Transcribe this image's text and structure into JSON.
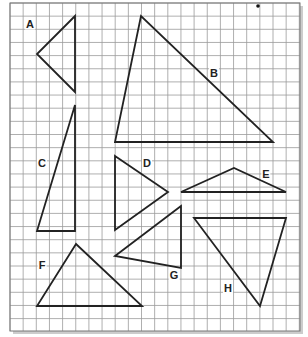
{
  "figure": {
    "grid": {
      "x0": 10,
      "y0": 3,
      "x1": 300,
      "y1": 331,
      "cell": 13.15,
      "line_color": "#9a9a9a",
      "border_color": "#777777",
      "background": "#ffffff",
      "shadow_color": "#cccccc"
    },
    "stroke_color": "#222222",
    "dot": {
      "x": 258,
      "y": 6
    },
    "triangles": [
      {
        "label": "A",
        "points": [
          [
            75,
            16
          ],
          [
            37,
            54
          ],
          [
            75,
            92
          ]
        ],
        "label_pos": [
          30,
          24
        ]
      },
      {
        "label": "B",
        "points": [
          [
            141,
            16
          ],
          [
            115,
            142
          ],
          [
            273,
            142
          ]
        ],
        "label_pos": [
          214,
          73
        ]
      },
      {
        "label": "C",
        "points": [
          [
            75,
            105
          ],
          [
            37,
            231
          ],
          [
            75,
            231
          ]
        ],
        "label_pos": [
          42,
          163
        ]
      },
      {
        "label": "D",
        "points": [
          [
            115,
            156
          ],
          [
            168,
            192
          ],
          [
            115,
            230
          ]
        ],
        "label_pos": [
          147,
          163
        ]
      },
      {
        "label": "E",
        "points": [
          [
            181,
            192
          ],
          [
            234,
            168
          ],
          [
            286,
            192
          ]
        ],
        "label_pos": [
          266,
          174
        ]
      },
      {
        "label": "F",
        "points": [
          [
            76,
            244
          ],
          [
            37,
            306
          ],
          [
            142,
            306
          ]
        ],
        "label_pos": [
          42,
          265
        ]
      },
      {
        "label": "G",
        "points": [
          [
            181,
            206
          ],
          [
            115,
            256
          ],
          [
            181,
            268
          ]
        ],
        "label_pos": [
          174,
          275
        ]
      },
      {
        "label": "H",
        "points": [
          [
            194,
            218
          ],
          [
            286,
            218
          ],
          [
            260,
            306
          ]
        ],
        "label_pos": [
          228,
          288
        ]
      }
    ]
  }
}
